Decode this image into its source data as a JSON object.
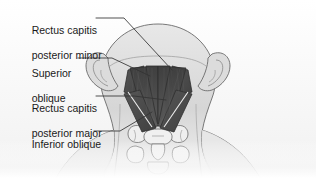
{
  "figure": {
    "view": "posterior",
    "background_color": "#f4f4f4",
    "muscle_color": "#4a4a4a",
    "muscle_color_light": "#6e6e6e",
    "highlight_color": "#e6e6e6",
    "skin_color": "#d9d9d9",
    "bone_color": "#ededed",
    "outline_color": "#555555",
    "leader_color": "#333333",
    "text_color": "#1a1a1a"
  },
  "labels": [
    {
      "id": "rectus-capitis-posterior-minor",
      "line1": "Rectus capitis",
      "line2": "posterior minor",
      "x": 20,
      "y": 11
    },
    {
      "id": "superior-oblique",
      "line1": "Superior",
      "line2": "oblique",
      "x": 20,
      "y": 54
    },
    {
      "id": "rectus-capitis-posterior-major",
      "line1": "Rectus capitis",
      "line2": "posterior major",
      "x": 20,
      "y": 89
    },
    {
      "id": "inferior-oblique",
      "line1": "Inferior oblique",
      "line2": "",
      "x": 20,
      "y": 127
    }
  ],
  "structures": [
    {
      "id": "head-outline",
      "name": "head and neck silhouette"
    },
    {
      "id": "left-ear",
      "name": "left ear"
    },
    {
      "id": "right-ear",
      "name": "right ear"
    },
    {
      "id": "cervical-vertebrae",
      "name": "cervical vertebrae"
    },
    {
      "id": "muscle-rcp-minor-left",
      "name": "rectus capitis posterior minor (left)"
    },
    {
      "id": "muscle-rcp-minor-right",
      "name": "rectus capitis posterior minor (right)"
    },
    {
      "id": "muscle-superior-oblique-left",
      "name": "superior oblique (left)"
    },
    {
      "id": "muscle-superior-oblique-right",
      "name": "superior oblique (right)"
    },
    {
      "id": "muscle-rcp-major-left",
      "name": "rectus capitis posterior major (left)"
    },
    {
      "id": "muscle-rcp-major-right",
      "name": "rectus capitis posterior major (right)"
    },
    {
      "id": "muscle-inferior-oblique-left",
      "name": "inferior oblique (left)"
    },
    {
      "id": "muscle-inferior-oblique-right",
      "name": "inferior oblique (right)"
    }
  ]
}
